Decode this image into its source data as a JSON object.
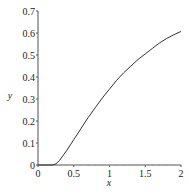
{
  "chart_data": {
    "type": "line",
    "title": "",
    "xlabel": "x",
    "ylabel": "y",
    "xlim": [
      0,
      2
    ],
    "ylim": [
      0,
      0.7
    ],
    "grid": false,
    "legend": null,
    "x_ticks": [
      "0",
      "0.5",
      "1",
      "1.5",
      "2"
    ],
    "y_ticks": [
      "0",
      "0.1",
      "0.2",
      "0.3",
      "0.4",
      "0.5",
      "0.6",
      "0.7"
    ],
    "series": [
      {
        "name": "curve",
        "color": "#333333",
        "x": [
          0,
          0.1,
          0.2,
          0.25,
          0.3,
          0.4,
          0.5,
          0.6,
          0.7,
          0.8,
          0.9,
          1.0,
          1.1,
          1.2,
          1.3,
          1.4,
          1.5,
          1.6,
          1.7,
          1.8,
          1.9,
          2.0
        ],
        "y": [
          0,
          0,
          0.0,
          0.005,
          0.02,
          0.065,
          0.115,
          0.165,
          0.215,
          0.26,
          0.305,
          0.345,
          0.385,
          0.42,
          0.45,
          0.48,
          0.505,
          0.53,
          0.555,
          0.575,
          0.592,
          0.607
        ]
      }
    ]
  }
}
